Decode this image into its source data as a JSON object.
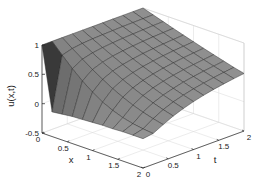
{
  "chart_data": {
    "type": "surface",
    "title": "",
    "xlabel": "x",
    "ylabel": "t",
    "zlabel": "u(x,t)",
    "x": [
      0,
      0.2,
      0.4,
      0.6,
      0.8,
      1.0,
      1.2,
      1.4,
      1.6,
      1.8,
      2.0
    ],
    "t": [
      0,
      0.2,
      0.4,
      0.6,
      0.8,
      1.0,
      1.2,
      1.4,
      1.6,
      1.8,
      2.0
    ],
    "u_rows_by_t": [
      [
        1.0,
        -0.08,
        -0.06,
        -0.04,
        -0.03,
        -0.02,
        -0.01,
        -0.01,
        0.0,
        0.0,
        0.0
      ],
      [
        1.0,
        0.823,
        0.655,
        0.503,
        0.371,
        0.263,
        0.18,
        0.118,
        0.074,
        0.045,
        0.026
      ],
      [
        1.0,
        0.874,
        0.751,
        0.636,
        0.527,
        0.429,
        0.343,
        0.268,
        0.206,
        0.155,
        0.114
      ],
      [
        1.0,
        0.897,
        0.796,
        0.698,
        0.606,
        0.519,
        0.438,
        0.366,
        0.302,
        0.246,
        0.197
      ],
      [
        1.0,
        0.911,
        0.823,
        0.737,
        0.655,
        0.576,
        0.503,
        0.434,
        0.371,
        0.315,
        0.263
      ],
      [
        1.0,
        0.92,
        0.842,
        0.764,
        0.689,
        0.617,
        0.549,
        0.484,
        0.423,
        0.368,
        0.317
      ],
      [
        1.0,
        0.927,
        0.855,
        0.784,
        0.715,
        0.648,
        0.584,
        0.523,
        0.466,
        0.411,
        0.361
      ],
      [
        1.0,
        0.933,
        0.866,
        0.8,
        0.735,
        0.673,
        0.612,
        0.554,
        0.499,
        0.447,
        0.398
      ],
      [
        1.0,
        0.937,
        0.874,
        0.812,
        0.751,
        0.693,
        0.636,
        0.58,
        0.527,
        0.477,
        0.429
      ],
      [
        1.0,
        0.94,
        0.882,
        0.823,
        0.765,
        0.709,
        0.655,
        0.602,
        0.551,
        0.503,
        0.456
      ],
      [
        1.0,
        0.944,
        0.888,
        0.832,
        0.777,
        0.724,
        0.671,
        0.621,
        0.572,
        0.525,
        0.48
      ]
    ],
    "xlim": [
      0,
      2
    ],
    "tlim": [
      0,
      2
    ],
    "zlim": [
      -0.5,
      1
    ],
    "x_ticks": [
      "0",
      "0.5",
      "1",
      "1.5",
      "2"
    ],
    "x_tick_values": [
      0,
      0.5,
      1,
      1.5,
      2
    ],
    "t_ticks": [
      "0",
      "0.5",
      "1",
      "1.5",
      "2"
    ],
    "t_tick_values": [
      0,
      0.5,
      1,
      1.5,
      2
    ],
    "z_ticks": [
      "-0.5",
      "0",
      "0.5",
      "1"
    ],
    "z_tick_values": [
      -0.5,
      0,
      0.5,
      1
    ],
    "grid": true,
    "legend": null,
    "colors": {
      "surface_face": "#8c8c8c",
      "surface_edge": "#2a2a2a",
      "axis": "#222222",
      "gridline": "#d8d8d8"
    }
  }
}
